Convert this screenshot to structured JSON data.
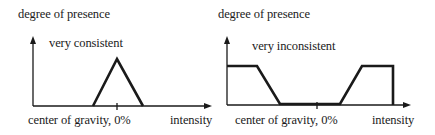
{
  "diagrams": [
    {
      "id": "consistent",
      "y_axis_label": "degree of presence",
      "curve_label": "very consistent",
      "x_center_label": "center of gravity, 0%",
      "x_axis_label": "intensity",
      "shape": "triangle"
    },
    {
      "id": "inconsistent",
      "y_axis_label": "degree of presence",
      "curve_label": "very inconsistent",
      "x_center_label": "center of gravity, 0%",
      "x_axis_label": "intensity",
      "shape": "inverted-trapezoid"
    }
  ],
  "colors": {
    "line": "#1a1a1a",
    "background": "#ffffff"
  }
}
